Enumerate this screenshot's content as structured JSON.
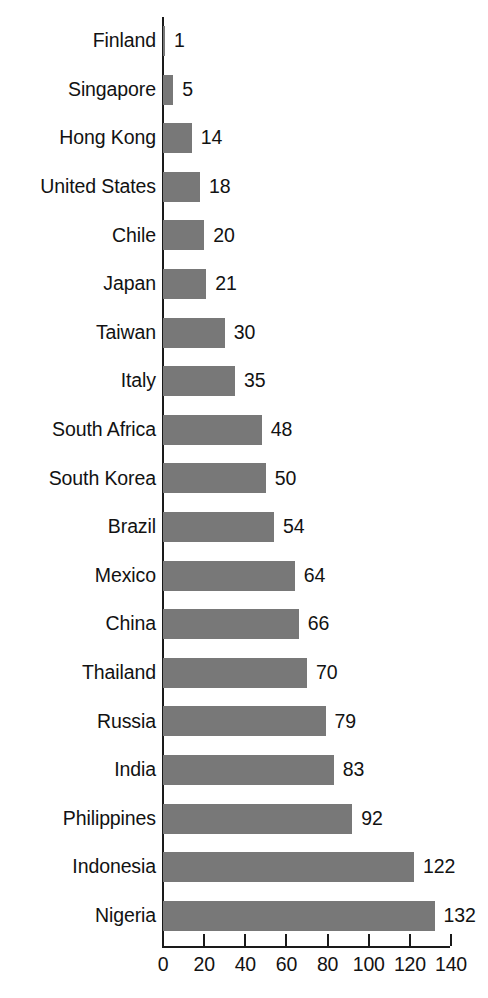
{
  "chart_data": {
    "type": "bar",
    "orientation": "horizontal",
    "title": "",
    "subtitle": "",
    "xlabel": "",
    "ylabel": "",
    "xlim": [
      0,
      140
    ],
    "grid": false,
    "legend": null,
    "value_labels_shown": true,
    "bar_color": "#787878",
    "axis_color": "#1a1a1a",
    "text_color": "#121212",
    "background_color": "#ffffff",
    "x_ticks": [
      0,
      20,
      40,
      60,
      80,
      100,
      120,
      140
    ],
    "x_tick_labels": [
      "0",
      "20",
      "40",
      "60",
      "80",
      "100",
      "120",
      "140"
    ],
    "categories": [
      "Finland",
      "Singapore",
      "Hong Kong",
      "United States",
      "Chile",
      "Japan",
      "Taiwan",
      "Italy",
      "South Africa",
      "South Korea",
      "Brazil",
      "Mexico",
      "China",
      "Thailand",
      "Russia",
      "India",
      "Philippines",
      "Indonesia",
      "Nigeria"
    ],
    "values": [
      1,
      5,
      14,
      18,
      20,
      21,
      30,
      35,
      48,
      50,
      54,
      64,
      66,
      70,
      79,
      83,
      92,
      122,
      132
    ],
    "value_labels": [
      "1",
      "5",
      "14",
      "18",
      "20",
      "21",
      "30",
      "35",
      "48",
      "50",
      "54",
      "64",
      "66",
      "70",
      "79",
      "83",
      "92",
      "122",
      "132"
    ]
  }
}
